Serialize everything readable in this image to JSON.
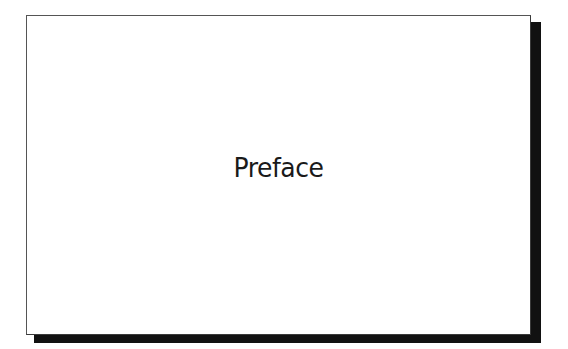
{
  "page": {
    "title": "Preface"
  },
  "colors": {
    "background": "#ffffff",
    "frame_border": "#3a3a3a",
    "shadow": "#111111",
    "text": "#1a1a1a"
  }
}
